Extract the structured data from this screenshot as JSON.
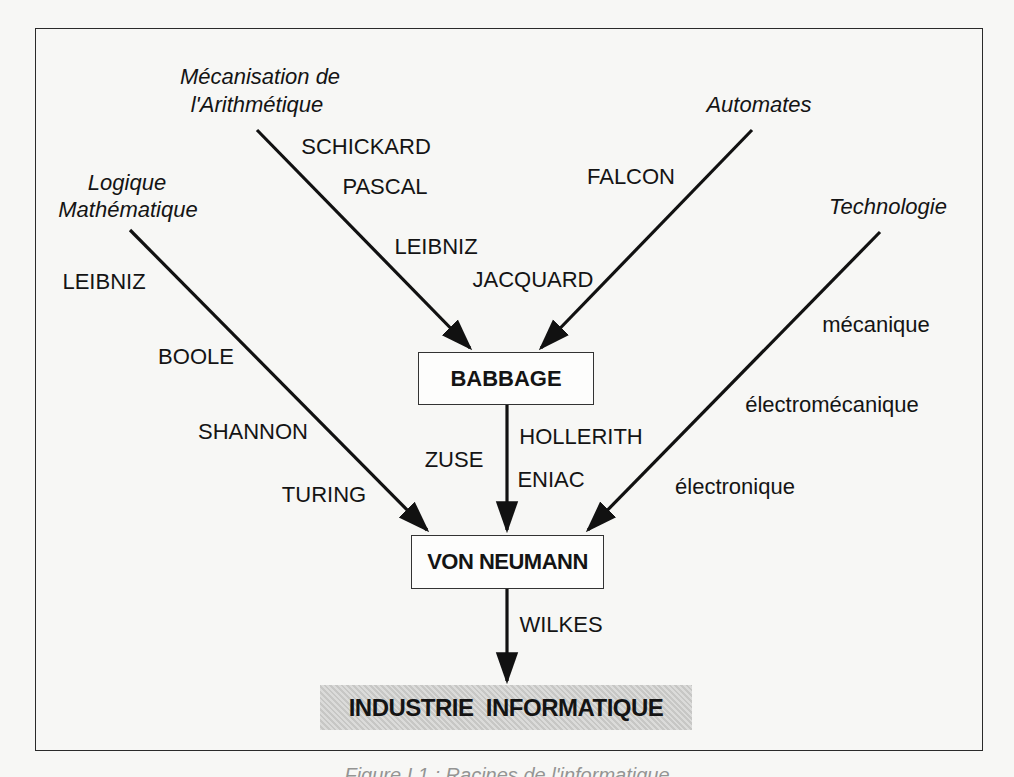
{
  "sources": {
    "arithmetic": {
      "line1": "Mécanisation de",
      "line2": "l'Arithmétique"
    },
    "logic": {
      "line1": "Logique",
      "line2": "Mathématique"
    },
    "automata": {
      "label": "Automates"
    },
    "technology": {
      "label": "Technologie"
    }
  },
  "arithmetic_names": [
    "SCHICKARD",
    "PASCAL",
    "LEIBNIZ"
  ],
  "automata_names": [
    "FALCON",
    "JACQUARD"
  ],
  "logic_names": [
    "LEIBNIZ",
    "BOOLE",
    "SHANNON",
    "TURING"
  ],
  "technology_stages": [
    "mécanique",
    "électromécanique",
    "électronique"
  ],
  "babbage_to_vn_names": {
    "left": [
      "ZUSE"
    ],
    "right": [
      "HOLLERITH",
      "ENIAC"
    ]
  },
  "vn_to_industry_names": [
    "WILKES"
  ],
  "nodes": {
    "babbage": "BABBAGE",
    "von_neumann": "VON NEUMANN",
    "industry": "INDUSTRIE  INFORMATIQUE"
  },
  "caption": "Figure I.1 : Racines de l'informatique",
  "colors": {
    "ink": "#141414",
    "shade": "#cfcfcd",
    "paper": "#f7f7f5"
  }
}
